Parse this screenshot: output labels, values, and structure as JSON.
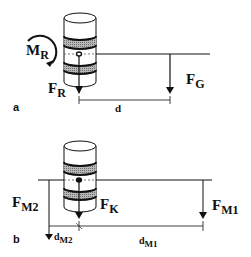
{
  "diagram": {
    "panel_a": {
      "panel_label": "a",
      "moment": {
        "main": "M",
        "sub": "R"
      },
      "force_r": {
        "main": "F",
        "sub": "R"
      },
      "force_g": {
        "main": "F",
        "sub": "G"
      },
      "distance": "d"
    },
    "panel_b": {
      "panel_label": "b",
      "force_m2": {
        "main": "F",
        "sub": "M2"
      },
      "force_k": {
        "main": "F",
        "sub": "K"
      },
      "force_m1": {
        "main": "F",
        "sub": "M1"
      },
      "distance_m2": {
        "main": "d",
        "sub": "M2"
      },
      "distance_m1": {
        "main": "d",
        "sub": "M1"
      }
    },
    "colors": {
      "line": "#111111",
      "band": "#9a9a9a",
      "background": "#ffffff"
    }
  }
}
